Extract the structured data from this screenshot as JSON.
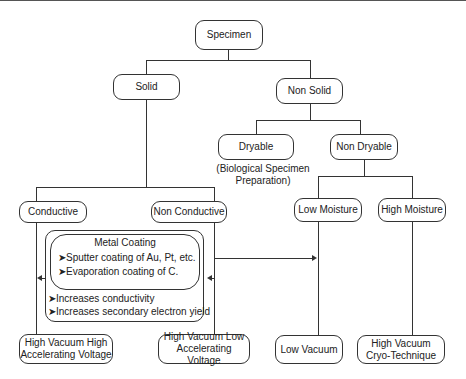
{
  "diagram": {
    "nodes": {
      "specimen": "Specimen",
      "solid": "Solid",
      "non_solid": "Non Solid",
      "dryable": "Dryable",
      "dryable_note": "(Biological Specimen\nPreparation)",
      "non_dryable": "Non Dryable",
      "conductive": "Conductive",
      "non_conductive": "Non Conductive",
      "low_moisture": "Low Moisture",
      "high_moisture": "High Moisture",
      "hv_high": "High Vacuum High\nAccelerating Voltage",
      "hv_low": "High Vacuum Low\nAccelerating Voltage",
      "low_vacuum": "Low Vacuum",
      "hv_cryo": "High Vacuum\nCryo-Technique"
    },
    "coating_box": {
      "title": "Metal Coating",
      "methods": [
        "➤Sputter coating of Au, Pt, etc.",
        "➤Evaporation coating of C."
      ],
      "benefits": [
        "➤Increases conductivity",
        "➤Increases secondary electron yield"
      ]
    }
  }
}
